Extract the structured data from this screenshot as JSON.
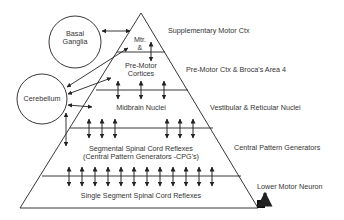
{
  "diagram": {
    "colors": {
      "line": "#222222",
      "text": "#333333",
      "background": "#ffffff"
    },
    "structures": {
      "basal_ganglia": "Basal\nGanglia",
      "basal_ganglia_line1": "Basal",
      "basal_ganglia_line2": "Ganglia",
      "cerebellum": "Cerebellum"
    },
    "pyramid_levels": {
      "mtr_line1": "Mtr.",
      "mtr_line2": "&",
      "premotor_line1": "Pre-Motor",
      "premotor_line2": "Cortices",
      "midbrain": "Midbrain Nuclei",
      "segmental_line1": "Segmental Spinal Cord Reflexes",
      "segmental_line2": "(Central Pattern Generators -CPG's)",
      "single_segment": "Single Segment Spinal Cord Reflexes"
    },
    "side_labels": {
      "supplementary": "Supplementary Motor Ctx",
      "premotor_broca": "Pre-Motor Ctx & Broca's Area 4",
      "vestibular": "Vestibular & Reticular Nuclei",
      "cpg": "Central Pattern Generators",
      "lower_motor_neuron": "Lower Motor Neuron"
    }
  }
}
